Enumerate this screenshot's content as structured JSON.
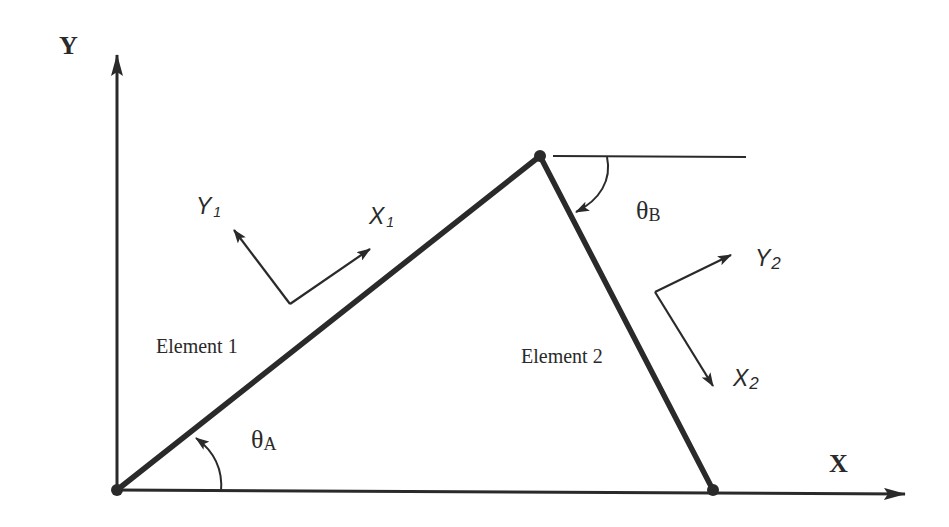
{
  "diagram": {
    "type": "two-element truss/frame geometry",
    "global_axes": {
      "x_label": "X",
      "y_label": "Y"
    },
    "elements": [
      {
        "label": "Element 1",
        "local_x": "X",
        "local_x_sub": "1",
        "local_y": "Y",
        "local_y_sub": "1"
      },
      {
        "label": "Element 2",
        "local_x": "X",
        "local_x_sub": "2",
        "local_y": "Y",
        "local_y_sub": "2"
      }
    ],
    "angles": [
      {
        "symbol": "θ",
        "subscript": "A",
        "description": "angle of Element 1 from X axis (counter-clockwise)"
      },
      {
        "symbol": "θ",
        "subscript": "B",
        "description": "angle of Element 2 from horizontal (clockwise)"
      }
    ],
    "nodes": [
      "origin",
      "apex",
      "right-support"
    ],
    "colors": {
      "line": "#2a2a2a",
      "background": "#ffffff"
    }
  }
}
